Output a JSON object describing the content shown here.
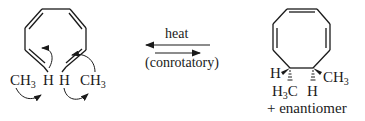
{
  "reactant": {
    "name": "diene-triene (octatetraene)",
    "labels": {
      "left_methyl": {
        "main": "CH",
        "sub": "3"
      },
      "left_h": "H",
      "right_h": "H",
      "right_methyl": {
        "main": "CH",
        "sub": "3"
      }
    }
  },
  "reaction": {
    "condition_top": "heat",
    "condition_bottom": "(conrotatory)",
    "arrow_top_direction": "left",
    "arrow_bottom_direction": "right"
  },
  "product": {
    "name": "cyclooctatriene",
    "labels": {
      "h_left": "H",
      "ch3_right": {
        "main": "CH",
        "sub": "3"
      },
      "h3c_bottom": {
        "pre": "H",
        "sub": "3",
        "post": "C"
      },
      "h_bottom": "H"
    },
    "note": "+ enantiomer"
  },
  "colors": {
    "ink": "#1a1a1a",
    "background": "#ffffff"
  }
}
